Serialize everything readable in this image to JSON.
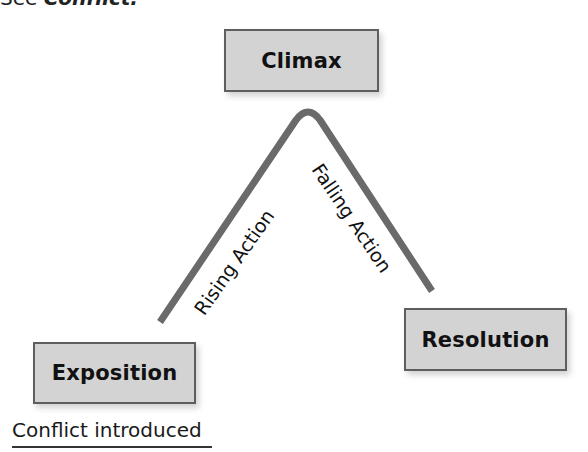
{
  "header": {
    "prefix": "See",
    "term": "Conflict."
  },
  "diagram": {
    "type": "plot-structure-arc",
    "nodes": {
      "climax": "Climax",
      "exposition": "Exposition",
      "resolution": "Resolution"
    },
    "edges": {
      "rising": "Rising Action",
      "falling": "Falling Action"
    },
    "annotation": "Conflict introduced",
    "colors": {
      "box_fill": "#d3d3d3",
      "box_border": "#5e5e5e",
      "arc_stroke": "#6a6a6a"
    }
  }
}
